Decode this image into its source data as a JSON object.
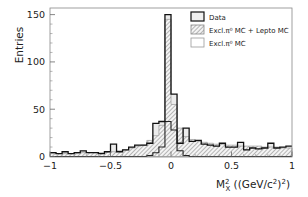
{
  "chart_data": {
    "type": "bar",
    "subtype": "stacked-step-histogram",
    "title": "",
    "xlabel": "M_X^2 ((GeV/c^2)^2)",
    "xlabel_parts": {
      "main": "M",
      "sup": "2",
      "sub": "X",
      "rest": " ((GeV/c",
      "rest_sup": "2",
      "rest_end": ")",
      "end_sup": "2",
      "close": ")"
    },
    "ylabel": "Entries",
    "xlim": [
      -1,
      1
    ],
    "ylim": [
      0,
      157
    ],
    "x_ticks": [
      -1,
      -0.5,
      0,
      0.5,
      1
    ],
    "x_tick_labels": [
      "−1",
      "−0.5",
      "0",
      "0.5",
      "1"
    ],
    "y_ticks": [
      0,
      50,
      100,
      150
    ],
    "y_tick_labels": [
      "0",
      "50",
      "100",
      "150"
    ],
    "grid": false,
    "legend_position": "upper right",
    "bin_edges_start": -1,
    "bin_width": 0.05,
    "bins": 40,
    "series": [
      {
        "name": "Data",
        "style": "black outline, light gray fill",
        "values": [
          4,
          3,
          5,
          3,
          4,
          6,
          4,
          4,
          3,
          5,
          13,
          5,
          7,
          10,
          12,
          12,
          14,
          35,
          37,
          150,
          66,
          14,
          30,
          16,
          17,
          13,
          12,
          11,
          14,
          10,
          10,
          15,
          7,
          9,
          8,
          9,
          14,
          9,
          10,
          11
        ]
      },
      {
        "name": "Excl.π⁰ MC + Lepto MC",
        "style": "diagonal hatch",
        "values": [
          3,
          3,
          3,
          3,
          3,
          4,
          4,
          4,
          4,
          5,
          5,
          6,
          7,
          9,
          11,
          12,
          17,
          22,
          33,
          145,
          55,
          30,
          21,
          18,
          16,
          15,
          14,
          13,
          13,
          12,
          12,
          11,
          11,
          11,
          11,
          10,
          10,
          10,
          9,
          9
        ]
      },
      {
        "name": "Excl.π⁰ MC",
        "style": "black outline, no fill",
        "values": [
          0,
          0,
          0,
          0,
          0,
          0,
          0,
          0,
          0,
          0,
          0,
          0,
          0,
          0,
          0,
          0,
          1,
          4,
          10,
          37,
          28,
          6,
          1,
          0,
          0,
          0,
          0,
          0,
          0,
          0,
          0,
          0,
          0,
          0,
          0,
          0,
          0,
          0,
          0,
          0
        ]
      }
    ]
  },
  "legend": {
    "items": [
      {
        "label": "Data"
      },
      {
        "label": "Excl.π⁰ MC + Lepto MC"
      },
      {
        "label": "Excl.π⁰ MC"
      }
    ]
  },
  "axes": {
    "ylabel": "Entries",
    "xlabel_main": "M",
    "xlabel_sup": "2",
    "xlabel_sub": "X",
    "xlabel_rest": " ((GeV/c",
    "xlabel_c_sup": "2",
    "xlabel_after": ")",
    "xlabel_outer_sup": "2",
    "xlabel_close": ")"
  }
}
